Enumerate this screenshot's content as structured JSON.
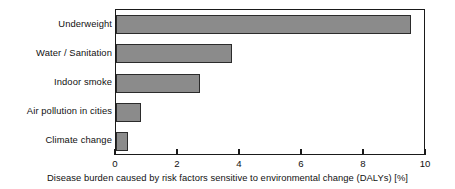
{
  "chart_data": {
    "type": "bar",
    "orientation": "horizontal",
    "title": "",
    "xlabel": "Disease burden caused by risk factors sensitive to environmental change (DALYs) [%]",
    "ylabel": "",
    "categories": [
      "Underweight",
      "Water / Sanitation",
      "Indoor smoke",
      "Air pollution in cities",
      "Climate change"
    ],
    "values": [
      9.5,
      3.75,
      2.7,
      0.8,
      0.4
    ],
    "xlim": [
      0,
      10
    ],
    "xticks": [
      0,
      2,
      4,
      6,
      8,
      10
    ],
    "xtick_labels": [
      "0",
      "2",
      "4",
      "6",
      "8",
      "10"
    ],
    "grid": false,
    "legend": null,
    "bar_fill_color": "#8b8b8b",
    "bar_edge_color": "#2b2b2b",
    "axis_color": "#1a1a1a",
    "background_color": "#ffffff"
  }
}
